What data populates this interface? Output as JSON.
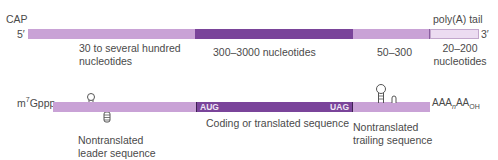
{
  "top_diagram": {
    "cap_label": "CAP",
    "five_prime": "5′",
    "three_prime": "3′",
    "polya_label": "poly(A) tail",
    "segments": [
      {
        "name": "leader",
        "color": "#c9a2d6"
      },
      {
        "name": "coding",
        "color": "#7a449a"
      },
      {
        "name": "trailer",
        "color": "#c9a2d6"
      },
      {
        "name": "polya",
        "color": "#e8d6ee"
      }
    ],
    "labels": {
      "leader_line1": "30 to several hundred",
      "leader_line2": "nucleotides",
      "coding": "300–3000 nucleotides",
      "trailer": "50–300",
      "polya_line1": "20–200",
      "polya_line2": "nucleotides"
    }
  },
  "bottom_diagram": {
    "cap_label_base": "m",
    "cap_label_sup": "7",
    "cap_label_rest": "Gppp",
    "start_codon": "AUG",
    "stop_codon": "UAG",
    "tail_label_base": "AAA",
    "tail_label_sub_n": "n",
    "tail_label_mid": "AA",
    "tail_label_sub_oh": "OH",
    "labels": {
      "leader_line1": "Nontranslated",
      "leader_line2": "leader sequence",
      "coding": "Coding or translated sequence",
      "trailer_line1": "Nontranslated",
      "trailer_line2": "trailing sequence"
    },
    "colors": {
      "light": "#c9a2d6",
      "dark": "#7a449a"
    }
  }
}
